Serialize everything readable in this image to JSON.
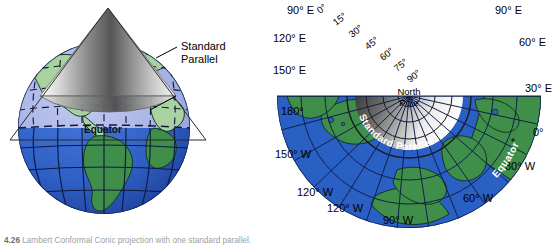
{
  "figure": {
    "caption_number": "4.26",
    "caption_text": "Lambert Conformal Conic projection with one standard parallel.",
    "background_color": "#ffffff"
  },
  "colors": {
    "ocean": "#2a5fc4",
    "ocean_light": "#a9b4e8",
    "land": "#3f8f4a",
    "land_light": "#a8d3a0",
    "cone_dark": "#3a3a3a",
    "cone_light": "#f2f2f2",
    "graticule": "#14224a",
    "label": "#000000",
    "label_white": "#ffffff"
  },
  "panels": [
    {
      "id": "globe",
      "name": "globe-with-cone",
      "labels": {
        "standard_parallel": "Standard\nParallel",
        "standard_parallel_line1": "Standard",
        "standard_parallel_line2": "Parallel",
        "equator": "Equator"
      }
    },
    {
      "id": "fan",
      "name": "unrolled-conic-projection",
      "labels": {
        "north_pole_line1": "North",
        "north_pole_line2": "Pole",
        "standard_parallel": "Standard Parallel",
        "equator": "Equator"
      },
      "latitude_ticks": [
        "0°",
        "15°",
        "30°",
        "45°",
        "60°",
        "75°",
        "90°"
      ],
      "longitude_labels_left": [
        "90° E",
        "120° E",
        "150° E",
        "180°",
        "150° W",
        "120° W"
      ],
      "longitude_labels_right": [
        "90° E",
        "60° E",
        "30° E",
        "0°",
        "30° W",
        "60° W"
      ],
      "longitude_labels_bottom": [
        "120° W",
        "90° W",
        "60° W"
      ]
    }
  ]
}
